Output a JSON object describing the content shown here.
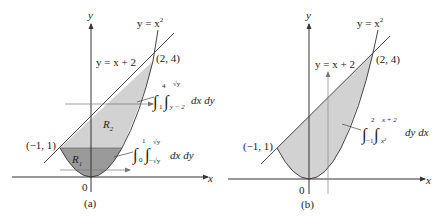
{
  "panels": [
    {
      "id": "a",
      "caption": "(a)",
      "axis_x": "x",
      "axis_y": "y",
      "origin_label": "0",
      "curve_label": "y = x²",
      "curve_label_base": "y = x",
      "curve_label_exp": "2",
      "line_label": "y = x + 2",
      "point_upper": "(2, 4)",
      "point_lower": "(−1, 1)",
      "region_1": "R",
      "region_1_sub": "1",
      "region_2": "R",
      "region_2_sub": "2",
      "integral_upper": {
        "outer_lower": "1",
        "outer_upper": "4",
        "inner_lower": "y − 2",
        "inner_upper": "√y",
        "differentials": "dx dy"
      },
      "integral_lower": {
        "outer_lower": "0",
        "outer_upper": "1",
        "inner_lower": "−√y",
        "inner_upper": "√y",
        "differentials": "dx dy"
      },
      "colors": {
        "region_1": "#9a9a9a",
        "region_2": "#d2d2d2",
        "stroke": "#444444"
      }
    },
    {
      "id": "b",
      "caption": "(b)",
      "axis_x": "x",
      "axis_y": "y",
      "origin_label": "0",
      "curve_label_base": "y = x",
      "curve_label_exp": "2",
      "line_label": "y = x + 2",
      "point_upper": "(2, 4)",
      "point_lower": "(−1, 1)",
      "integral": {
        "outer_lower": "−1",
        "outer_upper": "2",
        "inner_lower": "x²",
        "inner_upper": "x + 2",
        "differentials": "dy dx"
      },
      "colors": {
        "region": "#d2d2d2",
        "stroke": "#444444"
      }
    }
  ]
}
